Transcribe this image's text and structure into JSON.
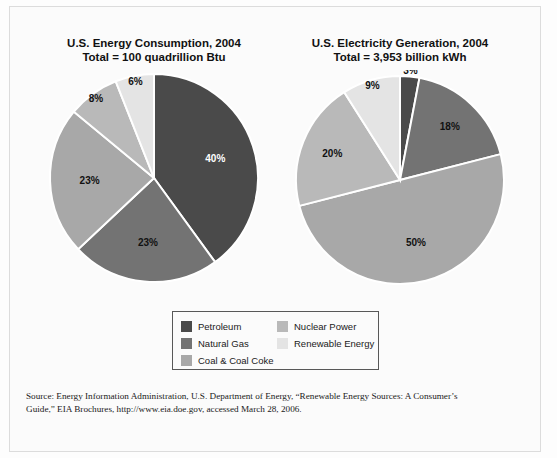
{
  "figure": {
    "background_color": "#fbfbfb",
    "border_color": "#dcdcdc"
  },
  "legend": {
    "border_color": "#585858",
    "column_1": [
      {
        "label": "Petroleum",
        "color": "#4a4a4a"
      },
      {
        "label": "Natural Gas",
        "color": "#737373"
      },
      {
        "label": "Coal & Coal Coke",
        "color": "#a8a8a8"
      }
    ],
    "column_2": [
      {
        "label": "Nuclear Power",
        "color": "#b9b9b9"
      },
      {
        "label": "Renewable Energy",
        "color": "#e4e4e4"
      }
    ]
  },
  "source": {
    "line1": "Source: Energy Information Administration, U.S. Department of Energy, “Renewable Energy Sources: A Consumer’s",
    "line2": "Guide,” EIA Brochures, http://www.eia.doe.gov, accessed March 28, 2006."
  },
  "chart_data": [
    {
      "type": "pie",
      "id": "energy-consumption",
      "title": "U.S. Energy Consumption, 2004",
      "subtitle": "Total = 100 quadrillion Btu",
      "xlabel": "",
      "ylabel": "",
      "legend_position": "bottom-center",
      "value_unit": "percent",
      "total_label": "Total = 100 quadrillion Btu",
      "categories": [
        "Petroleum",
        "Natural Gas",
        "Coal & Coal Coke",
        "Nuclear Power",
        "Renewable Energy"
      ],
      "values": [
        40,
        23,
        23,
        8,
        6
      ],
      "labels": [
        "40%",
        "23%",
        "23%",
        "8%",
        "6%"
      ],
      "colors": [
        "#4a4a4a",
        "#737373",
        "#a8a8a8",
        "#b9b9b9",
        "#e4e4e4"
      ],
      "label_fills": [
        "#ffffff",
        "#111111",
        "#111111",
        "#111111",
        "#111111"
      ],
      "start_angle_deg": 0,
      "direction": "clockwise",
      "geometry": {
        "cx": 124,
        "cy": 108,
        "r": 104
      }
    },
    {
      "type": "pie",
      "id": "electricity-generation",
      "title": "U.S. Electricity Generation, 2004",
      "subtitle": "Total = 3,953 billion kWh",
      "xlabel": "",
      "ylabel": "",
      "legend_position": "bottom-center",
      "value_unit": "percent",
      "total_label": "Total = 3,953 billion kWh",
      "categories": [
        "Petroleum",
        "Natural Gas",
        "Coal & Coal Coke",
        "Nuclear Power",
        "Renewable Energy"
      ],
      "values": [
        3,
        18,
        50,
        20,
        9
      ],
      "labels": [
        "3%",
        "18%",
        "50%",
        "20%",
        "9%"
      ],
      "colors": [
        "#4a4a4a",
        "#737373",
        "#a8a8a8",
        "#b9b9b9",
        "#e4e4e4"
      ],
      "label_fills": [
        "#111111",
        "#111111",
        "#111111",
        "#111111",
        "#111111"
      ],
      "start_angle_deg": 0,
      "direction": "clockwise",
      "geometry": {
        "cx": 124,
        "cy": 110,
        "r": 104
      }
    }
  ]
}
